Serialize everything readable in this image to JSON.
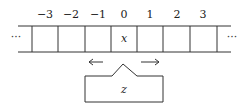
{
  "diagram": {
    "type": "turing-machine-tape",
    "tape": {
      "cell_indices": [
        "−3",
        "−2",
        "−1",
        "0",
        "1",
        "2",
        "3"
      ],
      "cell_contents": [
        "",
        "",
        "",
        "x",
        "",
        "",
        ""
      ],
      "left_ellipsis": "···",
      "right_ellipsis": "···"
    },
    "head": {
      "state_label": "z",
      "move_left_arrow": "←",
      "move_right_arrow": "→",
      "position_index": "0"
    }
  }
}
